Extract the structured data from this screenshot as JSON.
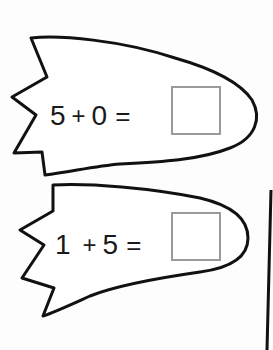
{
  "worksheet": {
    "problems": [
      {
        "a": "5",
        "op": "+",
        "b": "0",
        "eq": "=",
        "answer": ""
      },
      {
        "a": "1",
        "op": "+",
        "b": "5",
        "eq": "=",
        "answer": ""
      }
    ]
  },
  "colors": {
    "outline": "#111111",
    "answer_box_border": "#9a9a9a",
    "text": "#1a1a1a"
  }
}
